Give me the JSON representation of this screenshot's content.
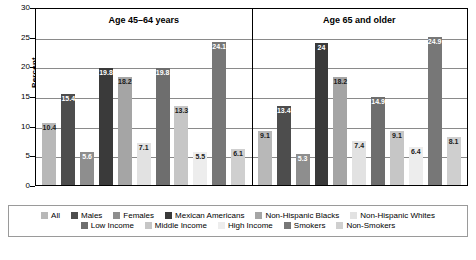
{
  "chart_data": {
    "type": "bar",
    "title": "",
    "xlabel": "",
    "ylabel": "Percent",
    "ylim": [
      0,
      30
    ],
    "yticks": [
      0,
      5,
      10,
      15,
      20,
      25,
      30
    ],
    "grid": true,
    "legend_position": "bottom",
    "categories": [
      "All",
      "Males",
      "Females",
      "Mexican Americans",
      "Non-Hispanic Blacks",
      "Non-Hispanic Whites",
      "Low Income",
      "Middle Income",
      "High Income",
      "Smokers",
      "Non-Smokers"
    ],
    "category_colors": [
      "#b8b8b8",
      "#4d4d4d",
      "#8e8e8e",
      "#3a3a3a",
      "#a5a5a5",
      "#e2e2e2",
      "#6e6e6e",
      "#c6c6c6",
      "#ededed",
      "#777777",
      "#cfcfcf"
    ],
    "panels": [
      {
        "title": "Age 45–64 years",
        "values": [
          10.4,
          15.4,
          5.6,
          19.8,
          18.2,
          7.1,
          19.8,
          13.3,
          5.5,
          24.1,
          6.1
        ],
        "labels": [
          "10.4",
          "15.4",
          "5.6",
          "19.8",
          "18.2",
          "7.1",
          "19.8",
          "13.3",
          "5.5",
          "24.1",
          "6.1"
        ]
      },
      {
        "title": "Age 65 and older",
        "values": [
          9.1,
          13.4,
          5.3,
          24.0,
          18.2,
          7.4,
          14.9,
          9.1,
          6.4,
          24.9,
          8.1
        ],
        "labels": [
          "9.1",
          "13.4",
          "5.3",
          "24",
          "18.2",
          "7.4",
          "14.9",
          "9.1",
          "6.4",
          "24.9",
          "8.1"
        ]
      }
    ],
    "legend_rows": [
      [
        "All",
        "Males",
        "Females",
        "Mexican Americans",
        "Non-Hispanic Blacks",
        "Non-Hispanic Whites"
      ],
      [
        "Low Income",
        "Middle Income",
        "High Income",
        "Smokers",
        "Non-Smokers"
      ]
    ]
  }
}
